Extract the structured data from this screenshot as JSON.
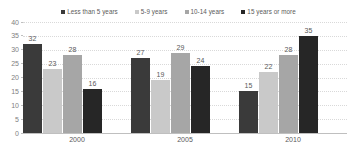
{
  "chart_data": {
    "type": "bar",
    "title": "",
    "subtitle": "",
    "xlabel": "",
    "ylabel": "",
    "categories": [
      "2000",
      "2005",
      "2010"
    ],
    "series": [
      {
        "name": "Less than 5 years",
        "color": "#3a3a3a",
        "values": [
          32,
          27,
          15
        ]
      },
      {
        "name": "5-9 years",
        "color": "#c9c9c9",
        "values": [
          23,
          19,
          22
        ]
      },
      {
        "name": "10-14 years",
        "color": "#a6a6a6",
        "values": [
          28,
          29,
          28
        ]
      },
      {
        "name": "15 years or more",
        "color": "#262626",
        "values": [
          16,
          24,
          35
        ]
      }
    ],
    "ylim": [
      0,
      40
    ],
    "ytick_step": 5,
    "yticks": [
      40,
      35,
      30,
      25,
      20,
      15,
      10,
      5,
      0
    ],
    "grid": true,
    "grid_axis": "y",
    "legend": true,
    "legend_position": "top",
    "data_labels": true,
    "bar_labels": [
      [
        "32",
        "23",
        "28",
        "16"
      ],
      [
        "27",
        "19",
        "29",
        "24"
      ],
      [
        "15",
        "22",
        "28",
        "35"
      ]
    ]
  },
  "style": {
    "background": "#ffffff",
    "grid_color": "#d9d9d9",
    "axis_color": "#bfbfbf",
    "label_color": "#595959",
    "tick_color": "#808080"
  }
}
